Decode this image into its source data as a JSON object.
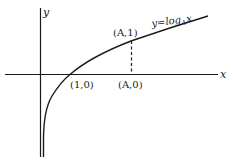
{
  "diagram": {
    "type": "function-graph",
    "function_label": {
      "prefix": "y=log",
      "subscript": "A",
      "suffix": "x"
    },
    "axes": {
      "x_label": "x",
      "y_label": "y"
    },
    "points": [
      {
        "label": "(1,0)",
        "x": 1,
        "y": 0
      },
      {
        "label": "(A,1)",
        "x": "A",
        "y": 1
      },
      {
        "label": "(A,0)",
        "x": "A",
        "y": 0
      }
    ],
    "dashed_segment": {
      "from": "(A,0)",
      "to": "(A,1)"
    },
    "colors": {
      "ink": "#1a1a1a",
      "background": "#ffffff"
    }
  }
}
